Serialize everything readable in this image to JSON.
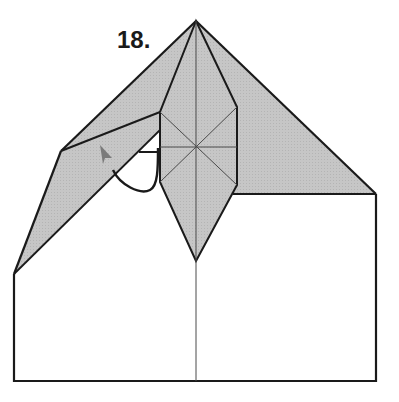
{
  "step": {
    "label": "18."
  },
  "colors": {
    "paper_colored": "#c4c4c4",
    "paper_white": "#ffffff",
    "line": "#1a1a1a",
    "crease": "#4a4a4a",
    "arrow_head": "#7a7a7a"
  },
  "diagram": {
    "elements": [
      "white-rectangle-base",
      "gray-left-flap",
      "gray-right-triangle",
      "central-diamond-with-star-creases",
      "center-vertical-crease",
      "fold-arrow"
    ]
  }
}
